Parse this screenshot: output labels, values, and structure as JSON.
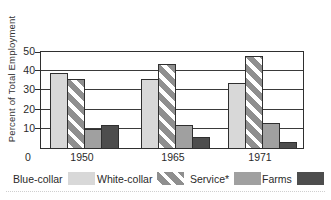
{
  "figure": {
    "origin_label": "0"
  },
  "chart_data": {
    "type": "bar",
    "title": "",
    "xlabel": "",
    "ylabel": "Percent of Total Employment",
    "categories": [
      "1950",
      "1965",
      "1971"
    ],
    "series": [
      {
        "name": "Blue-collar",
        "values": [
          39,
          36,
          34
        ],
        "fill": "#d8d8d8",
        "pattern": "solid"
      },
      {
        "name": "White-collar",
        "values": [
          36,
          44,
          48
        ],
        "fill": "#ffffff",
        "pattern": "diagonal-stripes",
        "stripe_color": "#8f8f8f"
      },
      {
        "name": "Service*",
        "values": [
          10,
          12,
          13
        ],
        "fill": "#a0a0a0",
        "pattern": "solid"
      },
      {
        "name": "Farms",
        "values": [
          12,
          5.5,
          3
        ],
        "fill": "#4d4d4d",
        "pattern": "solid"
      }
    ],
    "ylim": [
      0,
      50
    ],
    "y_ticks": [
      10,
      20,
      30,
      40,
      50
    ],
    "grid": "horizontal",
    "legend_position": "bottom",
    "axis_color": "#2f2f2f",
    "bar_border_color": "#2f2f2f"
  }
}
